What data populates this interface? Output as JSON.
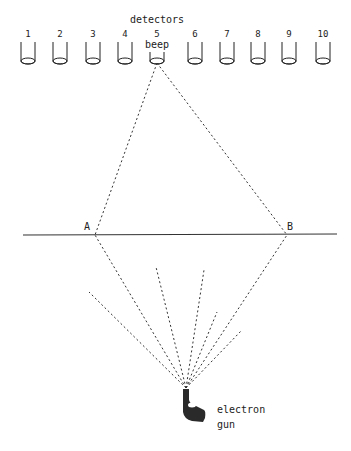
{
  "title": "detectors",
  "detectors": [
    {
      "label": "1",
      "x": 28
    },
    {
      "label": "2",
      "x": 60
    },
    {
      "label": "3",
      "x": 93
    },
    {
      "label": "4",
      "x": 125
    },
    {
      "label": "5",
      "x": 157
    },
    {
      "label": "6",
      "x": 195
    },
    {
      "label": "7",
      "x": 227
    },
    {
      "label": "8",
      "x": 258
    },
    {
      "label": "9",
      "x": 289
    },
    {
      "label": "10",
      "x": 323
    }
  ],
  "hit_label": "beep",
  "slit_points": {
    "a": "A",
    "b": "B"
  },
  "gun_label_line1": "electron",
  "gun_label_line2": "gun",
  "colors": {
    "ink": "#222222",
    "background": "#ffffff"
  }
}
